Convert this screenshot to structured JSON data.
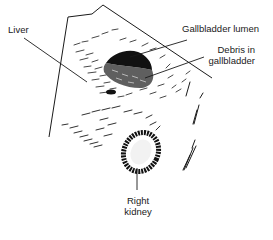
{
  "figure": {
    "type": "ultrasound-diagram",
    "labels": {
      "liver": "Liver",
      "gallbladder_lumen": "Gallbladder lumen",
      "debris_line1": "Debris in",
      "debris_line2": "gallbladder",
      "kidney_line1": "Right",
      "kidney_line2": "kidney"
    },
    "colors": {
      "ink": "#1a1a1a",
      "background": "#ffffff"
    }
  }
}
